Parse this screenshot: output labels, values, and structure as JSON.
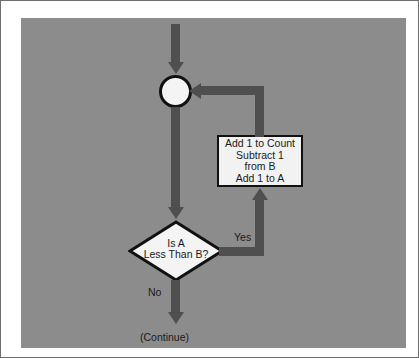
{
  "diagram": {
    "type": "flowchart",
    "background_color": "#8c8c8c",
    "connector_color": "#4f4f4f",
    "node_fill": "#f2f2f2",
    "node_outline": "#111111",
    "nodes": [
      {
        "id": "junction",
        "shape": "circle",
        "label": ""
      },
      {
        "id": "process",
        "shape": "rectangle",
        "lines": [
          "Add 1 to Count",
          "Subtract 1",
          "from B",
          "Add 1 to A"
        ]
      },
      {
        "id": "decision",
        "shape": "diamond",
        "lines": [
          "Is A",
          "Less Than B?"
        ]
      }
    ],
    "edge_labels": {
      "yes": "Yes",
      "no": "No",
      "continue": "(Continue)"
    }
  }
}
